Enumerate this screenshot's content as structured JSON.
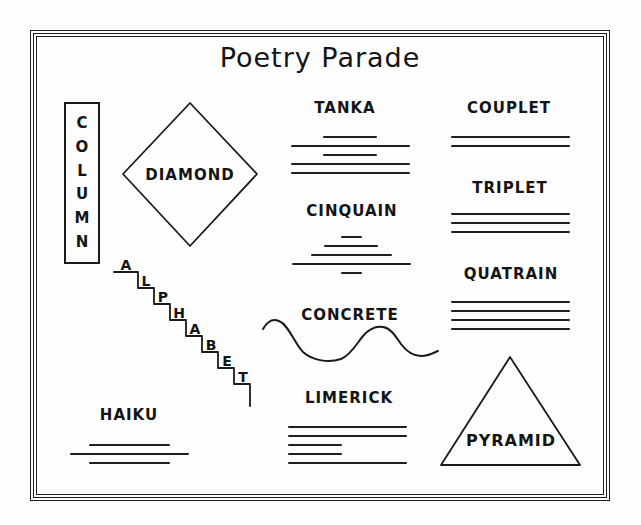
{
  "title": "Poetry Parade",
  "forms": {
    "column": {
      "name": "COLUMN",
      "letters": [
        "C",
        "O",
        "L",
        "U",
        "M",
        "N"
      ]
    },
    "diamond": {
      "label": "DIAMOND"
    },
    "tanka": {
      "label": "TANKA",
      "line_pattern": [
        "short",
        "long",
        "short",
        "long",
        "long"
      ]
    },
    "couplet": {
      "label": "COUPLET",
      "line_pattern": [
        "long",
        "long"
      ]
    },
    "cinquain": {
      "label": "CINQUAIN",
      "line_pattern": [
        "xshort",
        "short",
        "medium",
        "long",
        "xshort"
      ]
    },
    "triplet": {
      "label": "TRIPLET",
      "line_pattern": [
        "long",
        "long",
        "long"
      ]
    },
    "concrete": {
      "label": "CONCRETE"
    },
    "quatrain": {
      "label": "QUATRAIN",
      "line_pattern": [
        "long",
        "long",
        "long",
        "long"
      ]
    },
    "alphabet": {
      "name": "ALPHABET",
      "letters": [
        "A",
        "L",
        "P",
        "H",
        "A",
        "B",
        "E",
        "T"
      ]
    },
    "haiku": {
      "label": "HAIKU",
      "line_pattern": [
        "medium",
        "long",
        "medium"
      ]
    },
    "limerick": {
      "label": "LIMERICK",
      "line_pattern": [
        "long",
        "long",
        "short",
        "short",
        "long"
      ]
    },
    "pyramid": {
      "label": "PYRAMID"
    }
  },
  "colors": {
    "ink": "#1a1a1a",
    "paper": "#fdfdfd"
  }
}
